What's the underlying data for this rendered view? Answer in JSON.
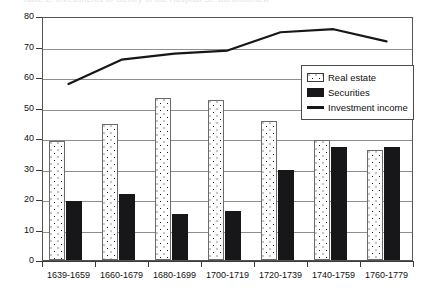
{
  "clipped_header": {
    "text": "Table 2.  Investments of Gentry in the Hospital St. Bartholomew"
  },
  "legend": {
    "position": "inside-top-right",
    "items": [
      {
        "label": "Real estate",
        "swatch": "dotted-pattern-swatch",
        "color": "#ffffff"
      },
      {
        "label": "Securities",
        "swatch": "solid-black-swatch",
        "color": "#17171a"
      },
      {
        "label": "Investment income",
        "swatch": "line-swatch",
        "color": "#17171a"
      }
    ]
  },
  "chart_data": {
    "type": "bar",
    "title": "",
    "xlabel": "",
    "ylabel": "",
    "ylim": [
      0,
      80
    ],
    "yticks": [
      0,
      10,
      20,
      30,
      40,
      50,
      60,
      70,
      80
    ],
    "grid": true,
    "categories": [
      "1639-1659",
      "1660-1679",
      "1680-1699",
      "1700-1719",
      "1720-1739",
      "1740-1759",
      "1760-1779"
    ],
    "series": [
      {
        "name": "Real estate",
        "type": "bar",
        "color": "#ffffff",
        "values": [
          39,
          44.5,
          53,
          52.5,
          45.5,
          39.5,
          36
        ]
      },
      {
        "name": "Securities",
        "type": "bar",
        "color": "#17171a",
        "values": [
          19.5,
          21.5,
          15,
          16,
          29.5,
          37,
          37
        ]
      },
      {
        "name": "Investment income",
        "type": "line",
        "color": "#17171a",
        "values": [
          58,
          66,
          68,
          69,
          75,
          76,
          72
        ]
      }
    ]
  }
}
